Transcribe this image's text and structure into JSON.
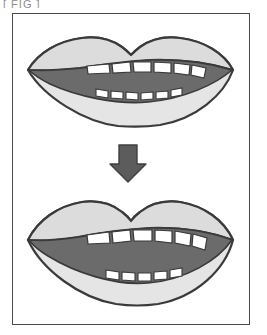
{
  "caption_fragment": {
    "text": "[ FIG ]"
  },
  "figure": {
    "panel_border_color": "#4a4a4a",
    "background_color": "#ffffff",
    "colors": {
      "lip_fill": "#e8e8e8",
      "lip_fill_upper": "#dedede",
      "outline": "#3a3a3a",
      "mouth_interior": "#6b6b6b",
      "tooth_fill": "#ffffff",
      "arrow_fill": "#5c5c5c"
    },
    "steps": [
      {
        "id": "mouth-top",
        "label": "slightly open mouth",
        "upper_teeth_count": 6,
        "lower_teeth_count": 6,
        "opening_height": "narrow"
      },
      {
        "id": "mouth-bottom",
        "label": "wide open mouth",
        "upper_teeth_count": 6,
        "lower_teeth_count": 5,
        "opening_height": "wide"
      }
    ],
    "arrow": {
      "direction": "down",
      "label": "transition-arrow"
    }
  }
}
